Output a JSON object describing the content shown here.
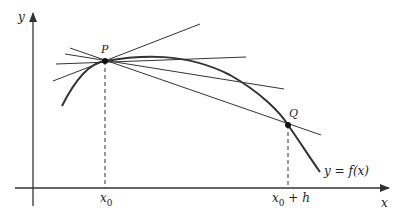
{
  "figure": {
    "colors": {
      "ink": "#333333",
      "background": "#ffffff"
    },
    "axes": {
      "x_label": "x",
      "y_label": "y"
    },
    "points": {
      "P": {
        "label": "P"
      },
      "Q": {
        "label": "Q"
      }
    },
    "tick_labels": {
      "x0": {
        "main": "x",
        "sub": "0"
      },
      "x0_plus_h": {
        "main": "x",
        "sub": "0",
        "suffix": " + h"
      }
    },
    "curve_label": "y = f(x)",
    "line_count": 5
  }
}
